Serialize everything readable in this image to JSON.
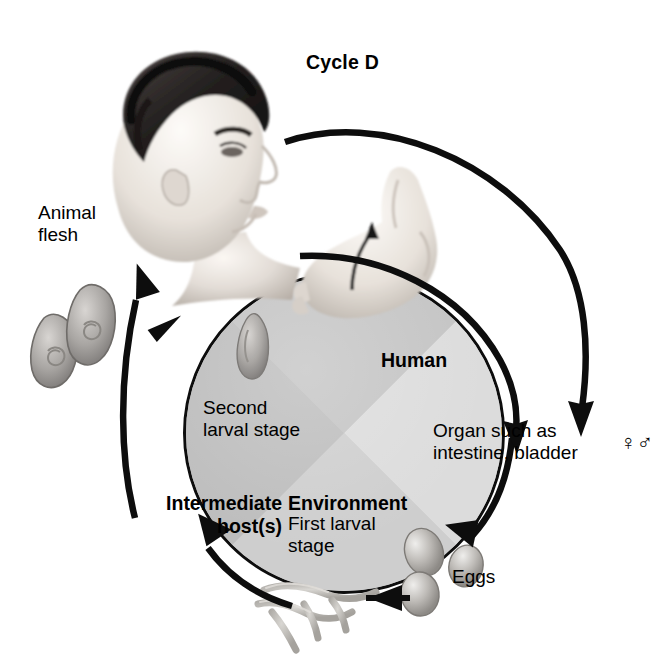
{
  "figure": {
    "title": "Cycle D",
    "type": "parasite-life-cycle-diagram"
  },
  "labels": {
    "animal_flesh": "Animal\nflesh",
    "human": "Human",
    "organ": "Organ such as\nintestine, bladder",
    "gender_symbols": "♀♂",
    "second_larval_stage": "Second\nlarval stage",
    "intermediate_hosts": "Intermediate\nhost(s)",
    "environment": "Environment",
    "first_larval_stage": "First larval\nstage",
    "eggs": "Eggs"
  },
  "wheel": {
    "segments": [
      {
        "name": "Human",
        "label": "Human",
        "color": "#dcdcdc"
      },
      {
        "name": "Organ",
        "label": "Organ such as intestine, bladder",
        "color": "#cecece"
      },
      {
        "name": "Environment",
        "label": "Environment",
        "color": "#bdbdbd"
      },
      {
        "name": "Second larval stage",
        "label": "Second larval stage",
        "color": "#c4c4c4"
      }
    ],
    "outline_color": "#0d0d0d"
  },
  "arrows": [
    {
      "name": "human-to-organ-arc",
      "from": "Human head",
      "to": "Organ such as intestine, bladder"
    },
    {
      "name": "organ-to-eggs-arc",
      "from": "Organ",
      "to": "Eggs"
    },
    {
      "name": "eggs-to-first-larval-arrow",
      "from": "Eggs",
      "to": "First larval stage"
    },
    {
      "name": "first-larval-to-intermediate-arc",
      "from": "First larval stage",
      "to": "Intermediate host(s)"
    },
    {
      "name": "intermediate-to-animal-flesh-arc",
      "from": "Intermediate host(s)",
      "to": "Animal flesh"
    },
    {
      "name": "animal-flesh-to-human-arc",
      "from": "Animal flesh",
      "to": "Human"
    },
    {
      "name": "skin-penetration-arrow",
      "from": "Environment",
      "to": "Foot"
    }
  ],
  "illustrations": [
    {
      "name": "human-head-photo",
      "description": "Man's head in profile facing right"
    },
    {
      "name": "human-foot-photo",
      "description": "Bare foot with arrow entering skin"
    },
    {
      "name": "encysted-larvae",
      "description": "Two leaf-shaped encysted larvae with spiral coils"
    },
    {
      "name": "second-larval-stage-cyst",
      "description": "Larva inside circle upper-left quadrant"
    },
    {
      "name": "eggs-cluster",
      "description": "Three oval eggs"
    },
    {
      "name": "first-stage-larvae",
      "description": "Thread-like worm larvae"
    }
  ]
}
